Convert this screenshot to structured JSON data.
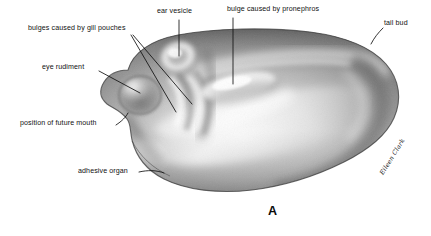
{
  "figure": {
    "panel_letter": "A",
    "signature": "Eileen Clark",
    "background_color": "#ffffff",
    "ink_color": "#111111",
    "width": 431,
    "height": 236
  },
  "labels": [
    {
      "id": "gill-pouches",
      "text": "bulges caused by gill pouches"
    },
    {
      "id": "ear-vesicle",
      "text": "ear vesicle"
    },
    {
      "id": "pronephros",
      "text": "bulge caused by pronephros"
    },
    {
      "id": "tail-bud",
      "text": "tail bud"
    },
    {
      "id": "eye-rudiment",
      "text": "eye rudiment"
    },
    {
      "id": "future-mouth",
      "text": "position of future mouth"
    },
    {
      "id": "adhesive-organ",
      "text": "adhesive organ"
    }
  ]
}
